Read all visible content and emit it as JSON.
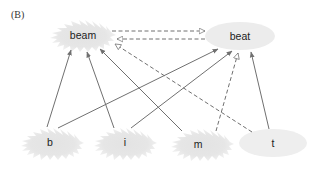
{
  "panel_label": "(B)",
  "nodes": {
    "beam": {
      "label": "beam",
      "shape": "starburst"
    },
    "beat": {
      "label": "beat",
      "shape": "ellipse"
    },
    "b": {
      "label": "b",
      "shape": "starburst"
    },
    "i": {
      "label": "i",
      "shape": "starburst"
    },
    "m": {
      "label": "m",
      "shape": "starburst"
    },
    "t": {
      "label": "t",
      "shape": "ellipse"
    }
  },
  "edges": [
    {
      "from": "b",
      "to": "beam",
      "style": "solid",
      "arrow": "filled"
    },
    {
      "from": "b",
      "to": "beat",
      "style": "solid",
      "arrow": "filled"
    },
    {
      "from": "i",
      "to": "beam",
      "style": "solid",
      "arrow": "filled"
    },
    {
      "from": "i",
      "to": "beat",
      "style": "solid",
      "arrow": "filled"
    },
    {
      "from": "m",
      "to": "beam",
      "style": "solid",
      "arrow": "filled"
    },
    {
      "from": "m",
      "to": "beat",
      "style": "dashed",
      "arrow": "open"
    },
    {
      "from": "t",
      "to": "beam",
      "style": "dashed",
      "arrow": "open"
    },
    {
      "from": "t",
      "to": "beat",
      "style": "solid",
      "arrow": "filled"
    },
    {
      "from": "beam",
      "to": "beat",
      "style": "dashed",
      "arrow": "open"
    },
    {
      "from": "beat",
      "to": "beam",
      "style": "dashed",
      "arrow": "open"
    }
  ],
  "colors": {
    "node_fill": "#e6e6e6",
    "edge": "#707070",
    "text": "#222222"
  }
}
